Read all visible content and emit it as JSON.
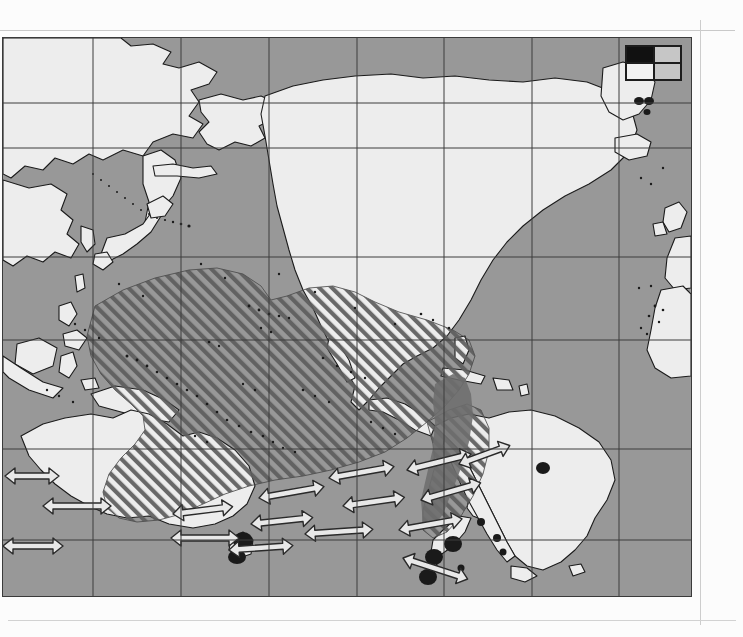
{
  "document": {
    "type": "scanned-figure-page",
    "figure_kind": "species-distribution-map"
  },
  "map": {
    "title": "Pacific Ocean distribution map",
    "projection": "rectangular-graticule",
    "region": "Pacific Ocean, centred on the South Pacific",
    "colors": {
      "ocean": "#989898",
      "land": "#ededed",
      "coastline": "#1b1b1b",
      "graticule": "#3c3c3c",
      "hatch_range": "#5e5e5e",
      "core_range": "#6d6d6d",
      "colony_marker": "#1a1a1a",
      "arrow_fill": "#e8e8e8",
      "arrow_stroke": "#2a2a2a",
      "plate_border": "#3a3a3a",
      "paper": "#fcfcfc"
    },
    "graticule": {
      "visible": true,
      "vertical_lines_x": [
        90,
        178,
        266,
        354,
        441,
        529,
        616
      ],
      "horizontal_lines_y": [
        65,
        110,
        219,
        302,
        411,
        502
      ]
    },
    "legend": {
      "name": "four-quadrant-symbol-key",
      "rows": 2,
      "columns": 2,
      "filled_quadrant": "top-left",
      "quadrant_fills": [
        "#111111",
        "#c6c6c6",
        "#f2f2f2",
        "#c6c6c6"
      ]
    },
    "features": {
      "hatched_range": {
        "label": "hatched distribution / foraging range",
        "pattern": "diagonal hatch, lower-left to upper-right",
        "extent": "broad band from the western tropical Pacific east and south-east to the coast of Chile"
      },
      "core_range": {
        "label": "solid dark range along the Chilean coast",
        "pattern": "solid mid-grey fill"
      },
      "colony_markers": {
        "label": "breeding colony markers",
        "shape": "filled ellipse",
        "locations": "Tasmania, New Zealand (North and South Islands), sub-antarctic islets"
      },
      "migration_arrows": {
        "label": "double-headed migration arrows",
        "style": "outlined open arrow, arrowheads at both ends",
        "count": 16,
        "band": "Southern Ocean, roughly 40-55 degrees south"
      },
      "island_dots": {
        "label": "island and island-group dots",
        "shape": "small filled dots and specks across the tropical Pacific"
      }
    },
    "landmasses": [
      "Siberia / Russian Far East",
      "Japan",
      "Korea",
      "China coast",
      "Philippines",
      "Indonesia / New Guinea",
      "Australia",
      "Tasmania",
      "New Zealand",
      "Alaska",
      "Canada",
      "United States",
      "Mexico",
      "Central America",
      "Caribbean islands",
      "South America",
      "Greenland",
      "Iceland",
      "British Isles",
      "Europe",
      "North-west Africa"
    ]
  }
}
